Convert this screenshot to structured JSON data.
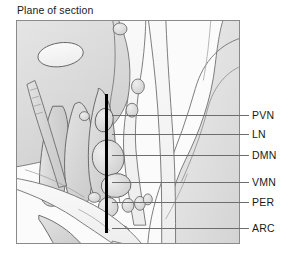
{
  "figure": {
    "title": "Plane of section",
    "type": "anatomical-diagram",
    "frame": {
      "x": 16,
      "y": 20,
      "width": 224,
      "height": 224,
      "border_color": "#8a8a8a"
    },
    "plane_of_section_marker": {
      "name": "plane-of-section-line",
      "orientation": "vertical",
      "color": "#000000",
      "x": 105,
      "y_top": 94,
      "y_bottom": 233
    },
    "palette": {
      "background": "#ffffff",
      "tissue_light": "#f1f1f1",
      "tissue_mid": "#dcdcdc",
      "tissue_dark": "#c6c6c6",
      "outline": "#6a6a6a",
      "text": "#1a1a1a",
      "leader_line": "#6d6d6d"
    }
  },
  "callouts": [
    {
      "abbr": "PVN",
      "line_y": 115,
      "line_x_start": 112,
      "line_x_end": 249,
      "label_x": 252,
      "label_y": 109
    },
    {
      "abbr": "LN",
      "line_y": 134,
      "line_x_start": 112,
      "line_x_end": 249,
      "label_x": 252,
      "label_y": 128
    },
    {
      "abbr": "DMN",
      "line_y": 155,
      "line_x_start": 112,
      "line_x_end": 249,
      "label_x": 252,
      "label_y": 149
    },
    {
      "abbr": "VMN",
      "line_y": 182,
      "line_x_start": 112,
      "line_x_end": 249,
      "label_x": 252,
      "label_y": 176
    },
    {
      "abbr": "PER",
      "line_y": 202,
      "line_x_start": 112,
      "line_x_end": 249,
      "label_x": 252,
      "label_y": 196
    },
    {
      "abbr": "ARC",
      "line_y": 228,
      "line_x_start": 112,
      "line_x_end": 249,
      "label_x": 252,
      "label_y": 222
    }
  ]
}
